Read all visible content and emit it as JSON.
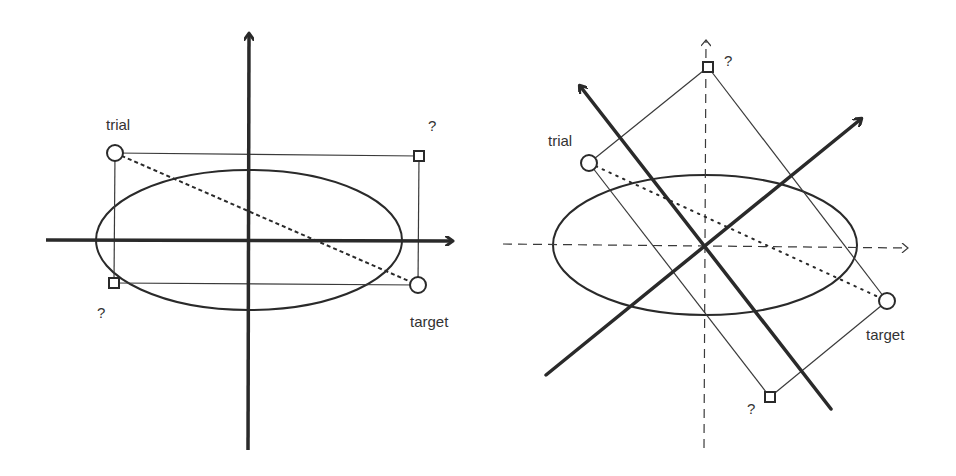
{
  "colors": {
    "background": "#ffffff",
    "stroke": "#2a2a2a",
    "thin": "#3a3a3a",
    "text": "#333333"
  },
  "panels": [
    {
      "id": "left",
      "description": "Axis-aligned search box around ellipse",
      "labels": {
        "trial": "trial",
        "target": "target",
        "corner_top_right": "?",
        "corner_bottom_left": "?"
      },
      "axes": {
        "x": {
          "x1": 46,
          "y1": 240,
          "x2": 454,
          "y2": 240,
          "style": "bold"
        },
        "y": {
          "x1": 249,
          "y1": 450,
          "x2": 249,
          "y2": 32,
          "style": "bold"
        }
      },
      "ellipse": {
        "cx": 249,
        "cy": 240,
        "rx": 153,
        "ry": 70
      },
      "points": {
        "trial": {
          "x": 115,
          "y": 153
        },
        "target": {
          "x": 418,
          "y": 285
        },
        "corner_top_right": {
          "x": 419,
          "y": 156
        },
        "corner_bottom_left": {
          "x": 114,
          "y": 283
        }
      }
    },
    {
      "id": "right",
      "description": "Rotated search box aligned to principal axes",
      "labels": {
        "trial": "trial",
        "target": "target",
        "corner_top": "?",
        "corner_bottom": "?"
      },
      "axes": {
        "x_dashed": {
          "x1": 503,
          "y1": 245,
          "x2": 908,
          "y2": 245,
          "style": "dashed"
        },
        "y_dashed": {
          "x1": 705,
          "y1": 448,
          "x2": 705,
          "y2": 40,
          "style": "dashed"
        },
        "principal_1": {
          "x1": 546,
          "y1": 375,
          "x2": 863,
          "y2": 117,
          "style": "bold"
        },
        "principal_2": {
          "x1": 831,
          "y1": 409,
          "x2": 578,
          "y2": 83,
          "style": "bold"
        }
      },
      "ellipse": {
        "cx": 705,
        "cy": 245,
        "rx": 152,
        "ry": 70
      },
      "points": {
        "trial": {
          "x": 589,
          "y": 163
        },
        "target": {
          "x": 887,
          "y": 301
        },
        "corner_top": {
          "x": 708,
          "y": 67
        },
        "corner_bottom": {
          "x": 770,
          "y": 397
        }
      }
    }
  ]
}
